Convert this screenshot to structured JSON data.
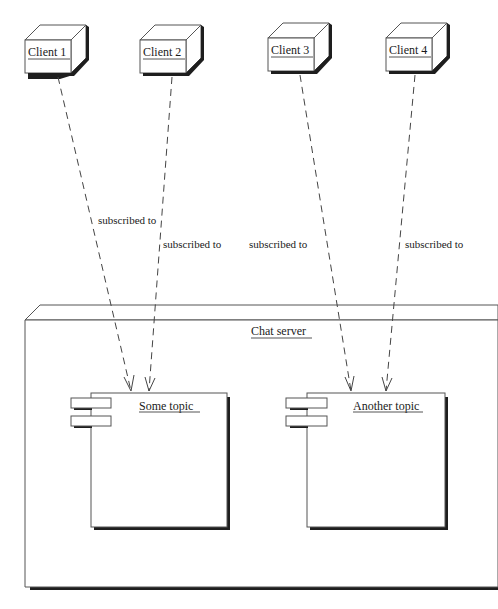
{
  "diagram": {
    "type": "UML deployment diagram",
    "colors": {
      "line": "#555555",
      "shadow": "#1e1e1e",
      "background": "#ffffff",
      "text": "#1a1a1a"
    },
    "clients": [
      {
        "id": "client1",
        "label": "Client 1",
        "x": 25,
        "y": 40,
        "w": 44,
        "h": 33
      },
      {
        "id": "client2",
        "label": "Client 2",
        "x": 140,
        "y": 40,
        "w": 44,
        "h": 33
      },
      {
        "id": "client3",
        "label": "Client 3",
        "x": 268,
        "y": 38,
        "w": 44,
        "h": 33
      },
      {
        "id": "client4",
        "label": "Client 4",
        "x": 386,
        "y": 38,
        "w": 44,
        "h": 33
      }
    ],
    "server": {
      "id": "chat-server",
      "label": "Chat server"
    },
    "components": [
      {
        "id": "some-topic",
        "label": "Some topic"
      },
      {
        "id": "another-topic",
        "label": "Another topic"
      }
    ],
    "edges": [
      {
        "from": "client1",
        "to": "some-topic",
        "label": "subscribed to"
      },
      {
        "from": "client2",
        "to": "some-topic",
        "label": "subscribed to"
      },
      {
        "from": "client3",
        "to": "another-topic",
        "label": "subscribed to"
      },
      {
        "from": "client4",
        "to": "another-topic",
        "label": "subscribed to"
      }
    ]
  }
}
